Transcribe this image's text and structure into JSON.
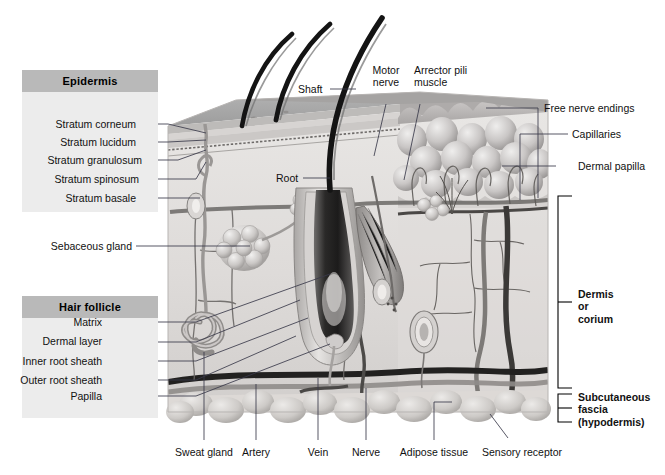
{
  "figure": {
    "accent_panel_bg": "#ececec",
    "accent_header_bg": "#b9b9b9",
    "hair_color": "#1a1a1a"
  },
  "panels": [
    {
      "header": "Epidermis",
      "items": [
        "Stratum corneum",
        "Stratum lucidum",
        "Stratum granulosum",
        "Stratum spinosum",
        "Stratum basale"
      ]
    },
    {
      "header": "Hair follicle",
      "items": [
        "Matrix",
        "Dermal layer",
        "Inner root sheath",
        "Outer root sheath",
        "Papilla"
      ]
    }
  ],
  "left_labels": [
    "Sebaceous gland"
  ],
  "top_labels": [
    {
      "text": "Shaft"
    },
    {
      "line1": "Motor",
      "line2": "nerve"
    },
    {
      "line1": "Arrector pili",
      "line2": "muscle"
    }
  ],
  "inner_labels": [
    "Root"
  ],
  "right_labels": [
    "Free nerve endings",
    "Capillaries",
    "Dermal papilla"
  ],
  "right_brackets": [
    {
      "line1": "Dermis",
      "line2": "or",
      "line3": "corium"
    },
    {
      "line1": "Subcutaneous",
      "line2": "fascia",
      "line3": "(hypodermis)"
    }
  ],
  "bottom_labels": [
    "Sweat gland",
    "Artery",
    "Vein",
    "Nerve",
    "Adipose tissue",
    "Sensory receptor"
  ]
}
